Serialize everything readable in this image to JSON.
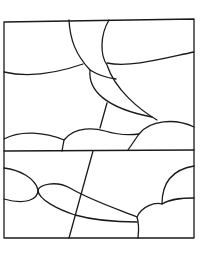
{
  "artwork": {
    "title": "",
    "description": "Line-art stained glass pattern: sky with sun rays and clouds over two stacked panels",
    "stroke_color": "#1a1a1a",
    "background_color": "#ffffff",
    "panels": [
      "upper-panel",
      "lower-panel"
    ]
  }
}
